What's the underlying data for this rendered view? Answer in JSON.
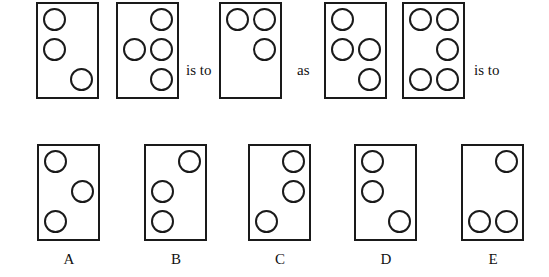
{
  "problem": {
    "type": "figure analogy",
    "connectors": {
      "is_to_1": "is to",
      "as": "as",
      "is_to_2": "is to"
    },
    "grid": {
      "columns": 2,
      "rows": 3
    },
    "top_row": [
      {
        "id": "P1",
        "filled_cells": [
          [
            0,
            0
          ],
          [
            1,
            0
          ],
          [
            2,
            1
          ]
        ]
      },
      {
        "id": "P2",
        "filled_cells": [
          [
            0,
            1
          ],
          [
            1,
            0
          ],
          [
            1,
            1
          ],
          [
            2,
            1
          ]
        ]
      },
      {
        "id": "P3",
        "filled_cells": [
          [
            0,
            0
          ],
          [
            0,
            1
          ],
          [
            1,
            1
          ]
        ]
      },
      {
        "id": "P4",
        "filled_cells": [
          [
            0,
            0
          ],
          [
            1,
            0
          ],
          [
            1,
            1
          ],
          [
            2,
            1
          ]
        ]
      },
      {
        "id": "P5",
        "filled_cells": [
          [
            0,
            0
          ],
          [
            0,
            1
          ],
          [
            1,
            1
          ],
          [
            2,
            0
          ],
          [
            2,
            1
          ]
        ]
      }
    ],
    "options": [
      {
        "label": "A",
        "filled_cells": [
          [
            0,
            0
          ],
          [
            1,
            1
          ],
          [
            2,
            0
          ]
        ]
      },
      {
        "label": "B",
        "filled_cells": [
          [
            0,
            1
          ],
          [
            1,
            0
          ],
          [
            2,
            0
          ]
        ]
      },
      {
        "label": "C",
        "filled_cells": [
          [
            0,
            1
          ],
          [
            1,
            1
          ],
          [
            2,
            0
          ]
        ]
      },
      {
        "label": "D",
        "filled_cells": [
          [
            0,
            0
          ],
          [
            1,
            0
          ],
          [
            2,
            1
          ]
        ]
      },
      {
        "label": "E",
        "filled_cells": [
          [
            0,
            1
          ],
          [
            2,
            0
          ],
          [
            2,
            1
          ]
        ]
      }
    ]
  }
}
